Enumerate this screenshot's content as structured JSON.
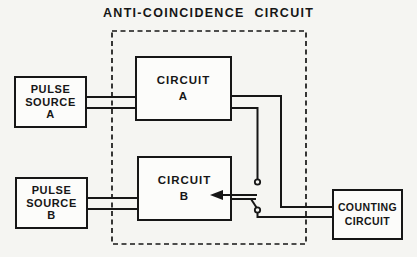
{
  "title": "ANTI-COINCIDENCE CIRCUIT",
  "colors": {
    "ink": "#161616",
    "paper": "#f5f5f2",
    "box_fill": "#fcfcfa"
  },
  "boxes": {
    "pulse_source_a": {
      "line1": "PULSE",
      "line2": "SOURCE",
      "line3": "A"
    },
    "pulse_source_b": {
      "line1": "PULSE",
      "line2": "SOURCE",
      "line3": "B"
    },
    "circuit_a": {
      "line1": "CIRCUIT",
      "line2": "A"
    },
    "circuit_b": {
      "line1": "CIRCUIT",
      "line2": "B"
    },
    "counting_circuit": {
      "line1": "COUNTING",
      "line2": "CIRCUIT"
    }
  },
  "icons": {
    "switch_contact_top": "open-contact",
    "switch_contact_bottom": "open-contact",
    "signal_arrow": "left-arrow"
  }
}
